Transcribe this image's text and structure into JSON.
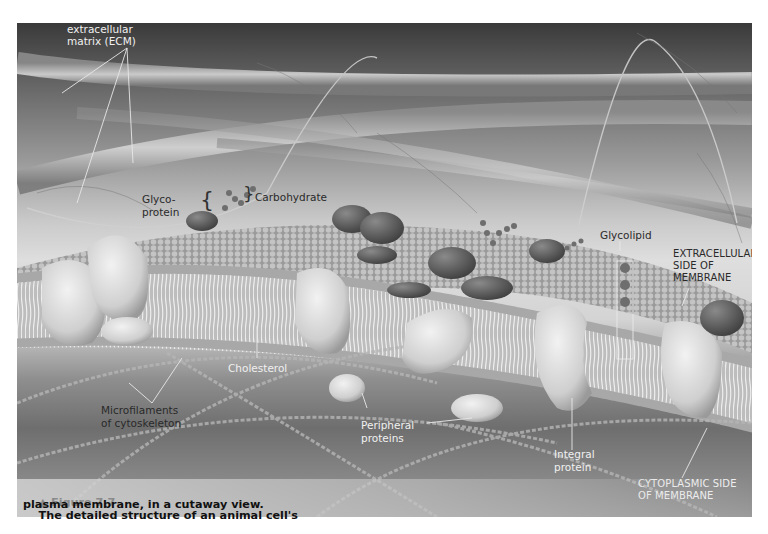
{
  "figure": {
    "number_label": "▲ Figure 7.7",
    "caption_line1": "The detailed structure of an animal cell's",
    "caption_line2": "plasma membrane, in a cutaway view."
  },
  "labels": {
    "ecm": "Fibers of\nextracellular\nmatrix (ECM)",
    "glycoprotein": "Glyco-\nprotein",
    "carbohydrate": "Carbohydrate",
    "glycolipid": "Glycolipid",
    "extracellular_side": "EXTRACELLULAR\nSIDE OF\nMEMBRANE",
    "cholesterol": "Cholesterol",
    "microfilaments": "Microfilaments\nof cytoskeleton",
    "peripheral_proteins": "Peripheral\nproteins",
    "integral_protein": "Integral\nprotein",
    "cytoplasmic_side": "CYTOPLASMIC SIDE\nOF MEMBRANE"
  },
  "colors": {
    "background_top": "#3a3a3a",
    "membrane_surface": "#b5b5b5",
    "protein_fill": "#d8d8d8",
    "label_dark": "#2a2a2a",
    "label_light": "#f0f0f0",
    "figure_number": "#8a8a8a"
  }
}
